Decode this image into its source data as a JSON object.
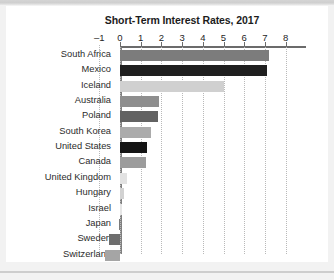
{
  "chart_data": {
    "type": "bar",
    "orientation": "horizontal",
    "title": "Short-Term Interest Rates, 2017",
    "xlabel": "",
    "ylabel": "",
    "xlim": [
      -1,
      8
    ],
    "xticks": [
      -1,
      0,
      1,
      2,
      3,
      4,
      5,
      6,
      7,
      8
    ],
    "xtick_labels": [
      "–1",
      "0",
      "1",
      "2",
      "3",
      "4",
      "5",
      "6",
      "7",
      "8"
    ],
    "grid": "vertical dotted gridlines at each tick",
    "legend": "none",
    "categories": [
      "South Africa",
      "Mexico",
      "Iceland",
      "Australia",
      "Poland",
      "South Korea",
      "United States",
      "Canada",
      "United Kingdom",
      "Hungary",
      "Israel",
      "Japan",
      "Sweden",
      "Switzerland"
    ],
    "values": [
      7.2,
      7.1,
      5.0,
      1.9,
      1.85,
      1.5,
      1.3,
      1.25,
      0.35,
      0.2,
      0.1,
      -0.05,
      -0.55,
      -0.72
    ],
    "bar_colors": [
      "#7c7c7c",
      "#1f1f1f",
      "#d0d0d0",
      "#8e8e8e",
      "#626262",
      "#ababab",
      "#141414",
      "#9c9c9c",
      "#e2e2e2",
      "#d2d2d2",
      "#e6e6e6",
      "#7a7a7a",
      "#6e6e6e",
      "#a5a5a5"
    ]
  },
  "colors": {
    "page_background": "#f2f2f2",
    "figure_background": "#ffffff",
    "axis": "#6b6b6b",
    "gridline": "#b9b9b9",
    "text": "#262626"
  }
}
